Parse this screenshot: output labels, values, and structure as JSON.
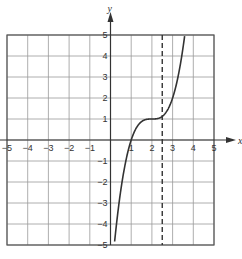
{
  "chart_data": {
    "type": "line",
    "title": "",
    "xlabel": "x",
    "ylabel": "y",
    "xlim": [
      -5,
      5
    ],
    "ylim": [
      -5,
      5
    ],
    "grid": true,
    "x_ticks": [
      "-5",
      "-4",
      "-3",
      "-2",
      "-1",
      "1",
      "2",
      "3",
      "4",
      "5"
    ],
    "y_ticks": [
      "5",
      "4",
      "3",
      "2",
      "1",
      "-1",
      "-2",
      "-3",
      "-4",
      "-5"
    ],
    "series": [
      {
        "name": "f(x)",
        "style": "solid",
        "points": [
          [
            0.18,
            -5
          ],
          [
            0.5,
            -2.4
          ],
          [
            1,
            0
          ],
          [
            1.5,
            0.88
          ],
          [
            2,
            1
          ],
          [
            2.5,
            1.13
          ],
          [
            3,
            2
          ],
          [
            3.3,
            3.2
          ],
          [
            3.59,
            5
          ]
        ]
      }
    ],
    "annotations": [
      {
        "type": "vertical-dashed-line",
        "x": 2.5,
        "label": ""
      }
    ],
    "colors": {
      "grid": "#999999",
      "axis": "#333333",
      "curve": "#333333"
    }
  }
}
